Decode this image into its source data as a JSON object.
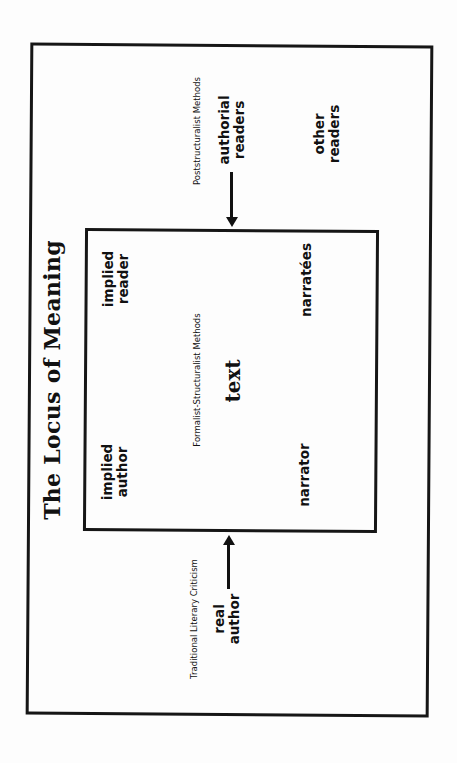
{
  "diagram": {
    "title": "The Locus of Meaning",
    "outer_region": {
      "method_label": "Poststructuralist Methods",
      "authorial_readers": [
        "authorial",
        "readers"
      ],
      "other_readers": [
        "other",
        "readers"
      ],
      "traditional_label": "Traditional Literary Criticism",
      "real_author": [
        "real",
        "author"
      ]
    },
    "inner_region": {
      "method_label": "Formalist-Structuralist Methods",
      "center": "text",
      "implied_reader": [
        "implied",
        "reader"
      ],
      "implied_author": [
        "implied",
        "author"
      ],
      "narratees": "narratées",
      "narrator": "narrator"
    },
    "arrows": [
      {
        "from": "authorial readers",
        "to": "text box",
        "direction": "down"
      },
      {
        "from": "real author",
        "to": "text box",
        "direction": "up"
      }
    ],
    "colors": {
      "line": "#161616",
      "background": "#fdfdfd"
    }
  }
}
